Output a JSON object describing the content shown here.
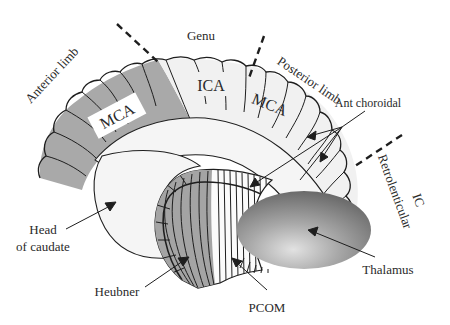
{
  "diagram": {
    "type": "anatomical-illustration",
    "colors": {
      "mca_dark": "#a9a9a9",
      "light_fill": "#f1f1f1",
      "caudate_fill": "#f5f5f5",
      "lentiform_grey": "#a4a4a4",
      "thalamus_dark": "#707070",
      "thalamus_light": "#d8d8d8",
      "outline": "#1e1e1e",
      "text": "#2a2a2a"
    },
    "regions": {
      "anterior_limb": "Anterior limb",
      "genu": "Genu",
      "posterior_limb": "Posterior limb",
      "retrolenticular_line1": "Retrolenticular",
      "retrolenticular_line2": "IC"
    },
    "territories": {
      "mca_anterior": "MCA",
      "ica": "ICA",
      "mca_posterior": "MCA"
    },
    "callouts": {
      "ant_choroidal": "Ant choroidal",
      "head_of_caudate_line1": "Head",
      "head_of_caudate_line2": "of caudate",
      "heubner": "Heubner",
      "pcom": "PCOM",
      "thalamus": "Thalamus"
    }
  }
}
